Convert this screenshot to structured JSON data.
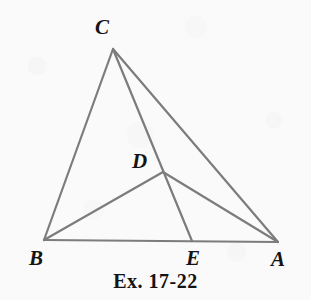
{
  "figure": {
    "caption": "Ex. 17-22",
    "background_color": "#fafafa",
    "line_color": "#7c7c7c",
    "line_width": 2.2,
    "label_color": "#141414",
    "canvas": {
      "width": 311,
      "height": 300
    }
  },
  "points": {
    "A": {
      "label": "A",
      "x": 278,
      "y": 242,
      "label_x": 271,
      "label_y": 249
    },
    "B": {
      "label": "B",
      "x": 44,
      "y": 240,
      "label_x": 29,
      "label_y": 248
    },
    "C": {
      "label": "C",
      "x": 113,
      "y": 49,
      "label_x": 95,
      "label_y": 17
    },
    "D": {
      "label": "D",
      "x": 163,
      "y": 172,
      "label_x": 132,
      "label_y": 151
    },
    "E": {
      "label": "E",
      "x": 192,
      "y": 241,
      "label_x": 186,
      "label_y": 248
    }
  },
  "segments": [
    {
      "name": "segment-CB",
      "from": "C",
      "to": "B"
    },
    {
      "name": "segment-CA",
      "from": "C",
      "to": "A"
    },
    {
      "name": "segment-BA",
      "from": "B",
      "to": "A"
    },
    {
      "name": "segment-CE",
      "from": "C",
      "to": "E"
    },
    {
      "name": "segment-BD",
      "from": "B",
      "to": "D"
    },
    {
      "name": "segment-DA",
      "from": "D",
      "to": "A"
    }
  ]
}
